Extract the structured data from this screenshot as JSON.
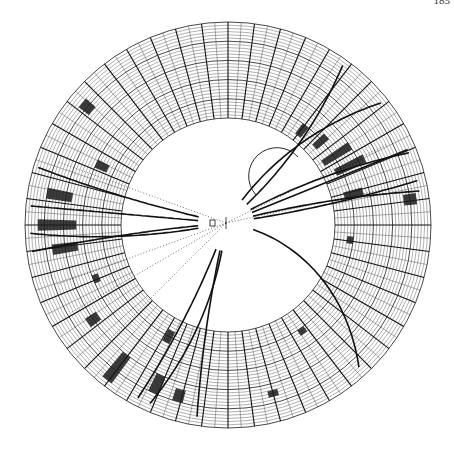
{
  "page": {
    "number": "185"
  },
  "diagram": {
    "type": "event-display",
    "colors": {
      "ink": "#111111",
      "grid": "#333333",
      "hit": "#1a1a1a",
      "background": "#ffffff"
    },
    "detector": {
      "sectors": 48,
      "layers": 30,
      "superlayer_every": 6
    },
    "vertex_label": "",
    "tracks": [
      {
        "id": "t1",
        "kind": "solid",
        "angle_deg": -58,
        "curv": 0.0018
      },
      {
        "id": "t2",
        "kind": "solid",
        "angle_deg": -40,
        "curv": -0.0012
      },
      {
        "id": "t3",
        "kind": "solid",
        "angle_deg": -30,
        "curv": 0.0008
      },
      {
        "id": "t4",
        "kind": "solid",
        "angle_deg": -22,
        "curv": 0.0
      },
      {
        "id": "t5",
        "kind": "solid",
        "angle_deg": -15,
        "curv": 0.0005
      },
      {
        "id": "t6",
        "kind": "solid",
        "angle_deg": -8,
        "curv": -0.0004
      },
      {
        "id": "t7",
        "kind": "solid",
        "angle_deg": 8,
        "curv": 0.0035
      },
      {
        "id": "t8",
        "kind": "solid",
        "angle_deg": 168,
        "curv": 0.0008
      },
      {
        "id": "t9",
        "kind": "solid",
        "angle_deg": 175,
        "curv": -0.0003
      },
      {
        "id": "t10",
        "kind": "solid",
        "angle_deg": 185,
        "curv": 0.0
      },
      {
        "id": "t11",
        "kind": "solid",
        "angle_deg": 192,
        "curv": 0.0004
      },
      {
        "id": "t12",
        "kind": "solid",
        "angle_deg": 110,
        "curv": 0.0006
      },
      {
        "id": "t13",
        "kind": "solid",
        "angle_deg": 103,
        "curv": -0.0004
      },
      {
        "id": "t14",
        "kind": "solid",
        "angle_deg": 96,
        "curv": 0.0015
      },
      {
        "id": "t15",
        "kind": "dotted",
        "angle_deg": 135,
        "curv": 0.0
      },
      {
        "id": "t16",
        "kind": "dotted",
        "angle_deg": 160,
        "curv": 0.0
      },
      {
        "id": "t17",
        "kind": "dotted",
        "angle_deg": 200,
        "curv": 0.0
      },
      {
        "id": "t18",
        "kind": "dotted",
        "angle_deg": -12,
        "curv": 0.0
      },
      {
        "id": "t19",
        "kind": "dotted",
        "angle_deg": -26,
        "curv": 0.0
      },
      {
        "id": "t20",
        "kind": "dotted",
        "angle_deg": 150,
        "curv": 0.0
      },
      {
        "id": "t21",
        "kind": "loop",
        "angle_deg": -50,
        "curv": 0.0
      }
    ],
    "hits": [
      {
        "sector_deg": -52,
        "layer_from": 2,
        "layer_to": 6
      },
      {
        "sector_deg": -42,
        "layer_from": 3,
        "layer_to": 8
      },
      {
        "sector_deg": -33,
        "layer_from": 2,
        "layer_to": 12
      },
      {
        "sector_deg": -26,
        "layer_from": 4,
        "layer_to": 14
      },
      {
        "sector_deg": -14,
        "layer_from": 4,
        "layer_to": 10
      },
      {
        "sector_deg": -8,
        "layer_from": 22,
        "layer_to": 26
      },
      {
        "sector_deg": 7,
        "layer_from": 4,
        "layer_to": 6
      },
      {
        "sector_deg": 172,
        "layer_from": 14,
        "layer_to": 22
      },
      {
        "sector_deg": 180,
        "layer_from": 14,
        "layer_to": 26
      },
      {
        "sector_deg": 190,
        "layer_from": 16,
        "layer_to": 24
      },
      {
        "sector_deg": 145,
        "layer_from": 16,
        "layer_to": 20
      },
      {
        "sector_deg": 205,
        "layer_from": 8,
        "layer_to": 12
      },
      {
        "sector_deg": 220,
        "layer_from": 22,
        "layer_to": 26
      },
      {
        "sector_deg": 118,
        "layer_from": 4,
        "layer_to": 8
      },
      {
        "sector_deg": 128,
        "layer_from": 18,
        "layer_to": 28
      },
      {
        "sector_deg": 114,
        "layer_from": 18,
        "layer_to": 24
      },
      {
        "sector_deg": 106,
        "layer_from": 20,
        "layer_to": 24
      },
      {
        "sector_deg": 55,
        "layer_from": 6,
        "layer_to": 8
      },
      {
        "sector_deg": 75,
        "layer_from": 20,
        "layer_to": 22
      },
      {
        "sector_deg": 158,
        "layer_from": 10,
        "layer_to": 12
      }
    ]
  }
}
